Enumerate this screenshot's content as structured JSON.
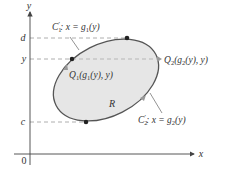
{
  "figure": {
    "axes": {
      "x_label": "x",
      "y_label": "y",
      "origin_label": "0"
    },
    "levels": {
      "d": "d",
      "y": "y",
      "c": "c"
    },
    "region_label": "R",
    "curves": {
      "c1_prefix": "C",
      "c1_sub": "1",
      "c1_prime": "′",
      "c1_eq": ": x = g",
      "c1_eq_sub": "1",
      "c1_eq_tail": "(y)",
      "c2_prefix": "C",
      "c2_sub": "2",
      "c2_prime": "′",
      "c2_eq": ": x = g",
      "c2_eq_sub": "2",
      "c2_eq_tail": "(y)"
    },
    "points": {
      "q1_prefix": "Q",
      "q1_sub": "1",
      "q1_args_open": "(g",
      "q1_args_sub": "1",
      "q1_args_tail": "(y), y)",
      "q2_prefix": "Q",
      "q2_sub": "2",
      "q2_args_open": "(g",
      "q2_args_sub": "2",
      "q2_args_tail": "(y), y)"
    },
    "colors": {
      "region_fill": "#e6e6e6",
      "boundary": "#555555",
      "axis": "#444444",
      "dashed": "#999999",
      "point": "#222222",
      "arrow_marker": "#999999"
    }
  }
}
